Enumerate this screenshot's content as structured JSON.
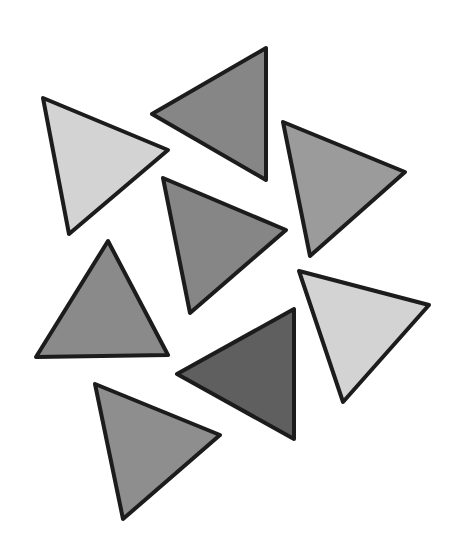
{
  "scene": {
    "description": "Eight grey triangles with thick black outlines, scattered on white",
    "background": "#ffffff",
    "outline_color": "#1c1c1c",
    "triangles": [
      {
        "id": "t1",
        "shade": "light",
        "fill": "#d3d3d3",
        "points": "43,98 168,150 69,234"
      },
      {
        "id": "t2",
        "shade": "medium-dark",
        "fill": "#868686",
        "points": "152,114 266,48 266,180"
      },
      {
        "id": "t3",
        "shade": "medium",
        "fill": "#9b9b9b",
        "points": "283,122 405,172 310,256"
      },
      {
        "id": "t4",
        "shade": "medium-dark",
        "fill": "#868686",
        "points": "163,178 286,230 190,313"
      },
      {
        "id": "t5",
        "shade": "medium-dark",
        "fill": "#8a8a8a",
        "points": "108,241 168,355 36,357"
      },
      {
        "id": "t6",
        "shade": "light",
        "fill": "#d3d3d3",
        "points": "299,271 429,305 343,402"
      },
      {
        "id": "t7",
        "shade": "dark",
        "fill": "#5f5f5f",
        "points": "177,374 294,309 294,439"
      },
      {
        "id": "t8",
        "shade": "medium",
        "fill": "#8e8e8e",
        "points": "95,384 220,435 123,519"
      }
    ]
  }
}
